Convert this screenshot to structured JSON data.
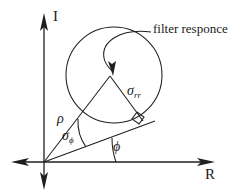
{
  "figure": {
    "background_color": "#ffffff",
    "stroke_color": "#1f1f1f"
  },
  "axes": {
    "vertical_label": "I",
    "horizontal_label": "R",
    "origin": {
      "x": 44,
      "y": 162
    },
    "vertical_top": {
      "x": 44,
      "y": 14
    },
    "vertical_bottom": {
      "x": 44,
      "y": 188
    },
    "horizontal_right": {
      "x": 213,
      "y": 162
    },
    "horizontal_left": {
      "x": 12,
      "y": 162
    },
    "arrow_directions": [
      "up",
      "down",
      "left",
      "right"
    ]
  },
  "annotations": {
    "filter_response": "filter responce",
    "rho": "ρ",
    "sigma_rr_symbol": "σ",
    "sigma_rr_sub": "rr",
    "sigma_phi_symbol": "σ",
    "sigma_phi_sub": "ϕ",
    "phi": "ϕ"
  },
  "geometry": {
    "circle": {
      "center_x": 114,
      "center_y": 75,
      "radius": 48,
      "description": "filter response circle"
    },
    "apex": {
      "x": 110,
      "y": 76
    },
    "rho_vector": {
      "from_x": 44,
      "from_y": 162,
      "to_x": 110,
      "to_y": 76
    },
    "phi_ray": {
      "from_x": 44,
      "from_y": 162,
      "to_x": 152,
      "to_y": 122
    },
    "sigma_rr_segment": {
      "from_x": 110,
      "from_y": 76,
      "to_x": 142,
      "to_y": 120
    },
    "right_angle_marker": {
      "x": 136,
      "y": 116,
      "size": 8
    },
    "sigma_phi_arc_radius": 44,
    "phi_arc_radius": 72,
    "leader_arrow_tip": {
      "x": 113,
      "y": 71
    }
  }
}
